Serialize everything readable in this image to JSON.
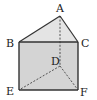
{
  "figure": {
    "type": "triangular-prism",
    "colors": {
      "background": "#ffffff",
      "front_face_fill": "#d4d4d4",
      "top_face_fill": "#e4e4e4",
      "edge": "#333333",
      "hidden_edge": "#444444"
    },
    "vertices": [
      {
        "name": "A",
        "x": 60,
        "y": 16,
        "label_x": 56,
        "label_y": 3
      },
      {
        "name": "B",
        "x": 19,
        "y": 42,
        "label_x": 6,
        "label_y": 38
      },
      {
        "name": "C",
        "x": 78,
        "y": 42,
        "label_x": 81,
        "label_y": 38
      },
      {
        "name": "D",
        "x": 60,
        "y": 66,
        "label_x": 51,
        "label_y": 56
      },
      {
        "name": "E",
        "x": 19,
        "y": 90,
        "label_x": 6,
        "label_y": 86
      },
      {
        "name": "F",
        "x": 78,
        "y": 90,
        "label_x": 80,
        "label_y": 87
      }
    ],
    "solid_edges": [
      "AB",
      "AC",
      "BC",
      "BE",
      "CF",
      "EF"
    ],
    "hidden_edges": [
      "AD",
      "DE",
      "DF"
    ]
  }
}
